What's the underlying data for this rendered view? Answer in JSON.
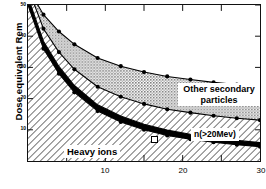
{
  "chart_data": {
    "type": "area",
    "title": "",
    "subtitle": "",
    "xlabel": "",
    "ylabel": "Dose equivalent Rem",
    "xlim": [
      0,
      30
    ],
    "ylim": [
      0,
      50
    ],
    "xticks": [
      10,
      20,
      30
    ],
    "xticklabels": [
      "10",
      "20",
      "30"
    ],
    "x_minor_tick_interval": 5,
    "yticks": [
      10,
      20,
      30,
      40,
      50
    ],
    "yticklabels": [
      "10",
      "20",
      "30",
      "40",
      "50"
    ],
    "grid": false,
    "legend_position": "in-plot-annotations",
    "stacked": true,
    "x": [
      0,
      2,
      4,
      6,
      9,
      12,
      15,
      18,
      21,
      24,
      27,
      30
    ],
    "series": [
      {
        "name": "Heavy ions",
        "fill": "diagonal-hatch",
        "values": [
          50,
          36,
          28,
          22,
          16,
          12.5,
          10,
          8.2,
          7,
          6,
          5.2,
          4.6
        ]
      },
      {
        "name": "black band",
        "fill": "solid-black",
        "values": [
          2.5,
          2.4,
          2.3,
          2.2,
          2.0,
          1.9,
          1.8,
          1.7,
          1.6,
          1.5,
          1.4,
          1.3
        ]
      },
      {
        "name": "n(>20Mev)",
        "fill": "diagonal-hatch",
        "values": [
          3.0,
          4.0,
          4.6,
          5.2,
          5.8,
          6.2,
          6.5,
          6.7,
          6.9,
          7.0,
          7.1,
          7.2
        ]
      },
      {
        "name": "Other secondary particles",
        "fill": "stipple-gray",
        "values": [
          0.0,
          4.5,
          6.6,
          8.0,
          9.2,
          9.8,
          10.2,
          10.5,
          10.6,
          10.7,
          10.8,
          10.8
        ]
      }
    ],
    "annotations": [
      {
        "id": "other",
        "text": "Other secondary particles"
      },
      {
        "id": "neutron",
        "text": "n(>20Mev)"
      },
      {
        "id": "heavy",
        "text": "Heavy ions"
      }
    ]
  },
  "axes": {
    "y_title": "Dose equivalent Rem",
    "y_ticks": [
      "50",
      "40",
      "30",
      "20",
      "10"
    ],
    "x_ticks": [
      "10",
      "20",
      "30"
    ]
  },
  "labels": {
    "other_secondary": "Other secondary particles",
    "neutron": "n(>20Mev)",
    "heavy_ions": "Heavy ions"
  },
  "colors": {
    "axis": "#111111",
    "stipple_gray": "#b4b4b4",
    "black_band": "#000000",
    "hatch": "#000000",
    "background": "#ffffff"
  }
}
